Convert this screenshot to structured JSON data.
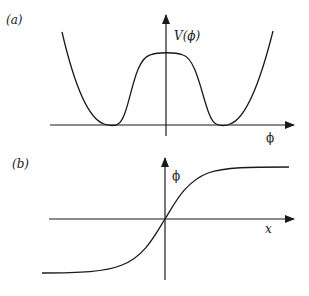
{
  "figure": {
    "panels": [
      {
        "id": "a",
        "label": "(a)",
        "y_axis_label": "V(ϕ)",
        "x_axis_label": "ϕ",
        "description": "Double-well potential V(ϕ) with two degenerate minima and a central maximum"
      },
      {
        "id": "b",
        "label": "(b)",
        "y_axis_label": "ϕ",
        "x_axis_label": "x",
        "description": "Kink solution ϕ(x) interpolating between the two vacua (tanh-shaped)"
      }
    ],
    "colors": {
      "ink": "#1a1a1a",
      "background": "#ffffff"
    }
  }
}
